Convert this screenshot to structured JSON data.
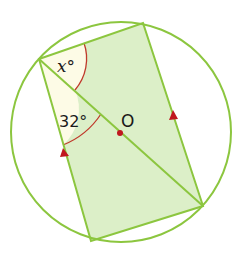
{
  "diagram": {
    "labels": {
      "angle_x": "x°",
      "angle_32": "32°",
      "centre": "O"
    },
    "colors": {
      "circle": "#8cc63f",
      "rect_fill": "#dcefc8",
      "rect_stroke": "#8cc63f",
      "angle_fill": "#fdfbe6",
      "angle_arc": "#c0392b",
      "arrow": "#c0171f",
      "centre_dot": "#c0171f"
    },
    "geometry": {
      "circle_center": [
        121,
        132
      ],
      "circle_radius": 110,
      "vertices": {
        "A": [
          39,
          59
        ],
        "B": [
          143,
          23
        ],
        "C": [
          203,
          206
        ],
        "D": [
          91,
          241
        ]
      }
    }
  }
}
